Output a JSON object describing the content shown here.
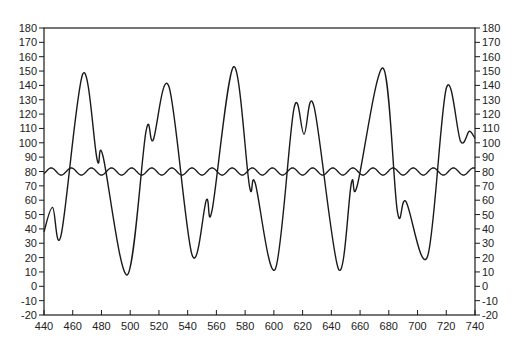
{
  "chart_data": {
    "type": "line",
    "title": "",
    "xlabel": "",
    "ylabel": "",
    "xlim": [
      440,
      740
    ],
    "ylim": [
      -20,
      180
    ],
    "grid": false,
    "legend": "none",
    "x_ticks": [
      440,
      460,
      480,
      500,
      520,
      540,
      560,
      580,
      600,
      620,
      640,
      660,
      680,
      700,
      720,
      740
    ],
    "y_ticks": [
      -20,
      -10,
      0,
      10,
      20,
      30,
      40,
      50,
      60,
      70,
      80,
      90,
      100,
      110,
      120,
      130,
      140,
      150,
      160,
      170,
      180
    ],
    "series": [
      {
        "name": "signal",
        "color": "#1a1a1a",
        "x": [
          440,
          446,
          452,
          467,
          477,
          481,
          498,
          511,
          516,
          527,
          543,
          553,
          557,
          572,
          583,
          587,
          601,
          614,
          621,
          628,
          645,
          654,
          658,
          676,
          686,
          692,
          707,
          720,
          730,
          736,
          740
        ],
        "y": [
          38,
          55,
          36,
          148,
          88,
          91,
          8,
          108,
          102,
          139,
          22,
          60,
          53,
          153,
          70,
          72,
          12,
          124,
          106,
          125,
          12,
          72,
          70,
          152,
          52,
          59,
          21,
          138,
          101,
          108,
          103
        ]
      },
      {
        "name": "oscillation",
        "color": "#1a1a1a",
        "baseline": 80,
        "amplitude": 2.5,
        "period": 14,
        "x_range": [
          440,
          740
        ]
      }
    ]
  }
}
